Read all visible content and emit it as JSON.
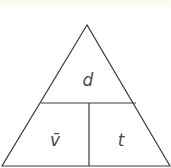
{
  "diagram": {
    "type": "formula-triangle",
    "top_cell": {
      "label": "d",
      "meaning": "distance"
    },
    "bottom_left_cell": {
      "label": "v̄",
      "meaning": "average velocity"
    },
    "bottom_right_cell": {
      "label": "t",
      "meaning": "time"
    }
  },
  "colors": {
    "stroke": "#3a3a3a",
    "text": "#4a4a4a",
    "background": "#ffffff",
    "top_band": "#fdfbe8"
  }
}
